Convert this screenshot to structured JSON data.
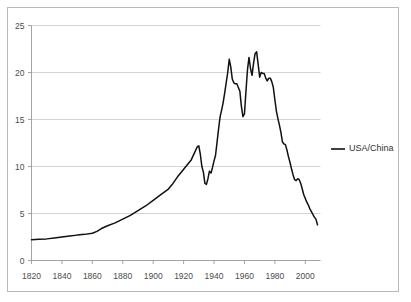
{
  "chart_data": {
    "type": "line",
    "title": "",
    "subtitle": "",
    "xlabel": "",
    "ylabel": "",
    "xlim": [
      1820,
      2010
    ],
    "ylim": [
      0,
      25
    ],
    "grid": true,
    "grid_axis": "y",
    "legend_position": "right",
    "line_color": "#111111",
    "grid_color": "#c8c8c8",
    "border_color": "#9a9a9a",
    "frame_color": "#b9b9b9",
    "background": "#ffffff",
    "y_ticks": [
      0,
      5,
      10,
      15,
      20,
      25
    ],
    "y_tick_labels": [
      "0",
      "5",
      "10",
      "15",
      "20",
      "25"
    ],
    "x_ticks": [
      1820,
      1840,
      1860,
      1880,
      1900,
      1920,
      1940,
      1960,
      1980,
      2000
    ],
    "x_tick_labels": [
      "1820",
      "1840",
      "1860",
      "1880",
      "1900",
      "1920",
      "1940",
      "1960",
      "1980",
      "2000"
    ],
    "legend": [
      "USA/China"
    ],
    "series": [
      {
        "name": "USA/China",
        "color": "#111111",
        "x": [
          1820,
          1825,
          1830,
          1835,
          1840,
          1845,
          1850,
          1855,
          1860,
          1863,
          1866,
          1870,
          1875,
          1880,
          1885,
          1890,
          1895,
          1900,
          1905,
          1910,
          1913,
          1916,
          1919,
          1922,
          1925,
          1927,
          1929,
          1930,
          1931,
          1932,
          1933,
          1934,
          1935,
          1936,
          1937,
          1938,
          1939,
          1940,
          1941,
          1942,
          1943,
          1944,
          1945,
          1946,
          1947,
          1948,
          1949,
          1950,
          1951,
          1952,
          1953,
          1954,
          1955,
          1956,
          1957,
          1958,
          1959,
          1960,
          1961,
          1962,
          1963,
          1964,
          1965,
          1966,
          1967,
          1968,
          1969,
          1970,
          1971,
          1972,
          1973,
          1974,
          1975,
          1976,
          1977,
          1978,
          1979,
          1980,
          1981,
          1982,
          1983,
          1984,
          1985,
          1986,
          1987,
          1988,
          1989,
          1990,
          1991,
          1992,
          1993,
          1994,
          1995,
          1996,
          1997,
          1998,
          1999,
          2000,
          2001,
          2002,
          2003,
          2004,
          2005,
          2006,
          2007,
          2008
        ],
        "values": [
          2.2,
          2.25,
          2.3,
          2.4,
          2.5,
          2.6,
          2.7,
          2.78,
          2.9,
          3.1,
          3.4,
          3.7,
          4.0,
          4.4,
          4.8,
          5.3,
          5.8,
          6.4,
          7.0,
          7.6,
          8.2,
          8.9,
          9.5,
          10.1,
          10.7,
          11.4,
          12.1,
          12.2,
          11.3,
          10.0,
          9.4,
          8.2,
          8.1,
          8.7,
          9.5,
          9.3,
          9.9,
          10.6,
          11.2,
          12.6,
          14.0,
          15.3,
          16.0,
          16.8,
          17.8,
          18.9,
          20.0,
          21.4,
          20.6,
          19.3,
          18.9,
          18.8,
          18.8,
          18.4,
          18.0,
          16.4,
          15.3,
          15.6,
          18.0,
          20.3,
          21.6,
          20.4,
          19.7,
          21.0,
          22.0,
          22.2,
          20.9,
          19.5,
          20.0,
          19.9,
          19.9,
          19.4,
          19.1,
          19.4,
          19.4,
          19.0,
          18.4,
          17.1,
          15.9,
          15.1,
          14.4,
          13.6,
          12.6,
          12.4,
          12.3,
          11.7,
          11.0,
          10.4,
          9.7,
          9.1,
          8.6,
          8.5,
          8.7,
          8.6,
          8.2,
          7.6,
          7.0,
          6.6,
          6.2,
          5.9,
          5.5,
          5.2,
          4.9,
          4.6,
          4.4,
          3.8
        ]
      }
    ]
  },
  "legend": {
    "entries": [
      {
        "label": "USA/China",
        "color": "#111111"
      }
    ]
  }
}
